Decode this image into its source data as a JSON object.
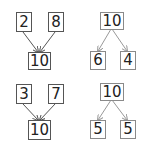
{
  "colors": {
    "box_border": "#555555",
    "box_border_light": "#8a8a8a",
    "arrow_dark": "#555555",
    "arrow_light": "#999999",
    "text": "#222222"
  },
  "bonds": [
    {
      "type": "combine",
      "parts": [
        "2",
        "8"
      ],
      "whole": "10"
    },
    {
      "type": "split",
      "whole": "10",
      "parts": [
        "6",
        "4"
      ]
    },
    {
      "type": "combine",
      "parts": [
        "3",
        "7"
      ],
      "whole": "10"
    },
    {
      "type": "split",
      "whole": "10",
      "parts": [
        "5",
        "5"
      ]
    }
  ]
}
